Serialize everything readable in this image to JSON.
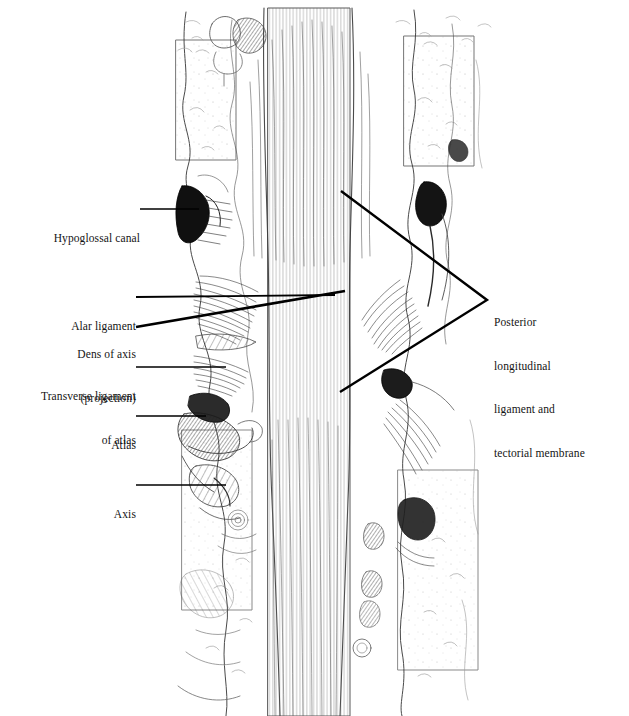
{
  "figure": {
    "kind": "anatomical-illustration",
    "style": "pen-and-ink line drawing",
    "background_color": "#ffffff",
    "ink_color": "#141414",
    "leader_color": "#000000"
  },
  "labels": {
    "hypoglossal_canal": {
      "text": "Hypoglossal canal",
      "align": "right",
      "x": 140,
      "y": 202
    },
    "alar_ligament": {
      "text": "Alar ligament",
      "align": "right",
      "x": 133,
      "y": 290
    },
    "dens_of_axis": {
      "line1": "Dens of axis",
      "line2": "(projection)",
      "align": "right",
      "x": 133,
      "y": 318
    },
    "transverse_ligament": {
      "line1": "Transverse ligament",
      "line2": "of atlas",
      "align": "right",
      "x": 133,
      "y": 360
    },
    "atlas": {
      "text": "Atlas",
      "align": "right",
      "x": 133,
      "y": 409
    },
    "axis": {
      "text": "Axis",
      "align": "right",
      "x": 133,
      "y": 478
    },
    "posterior_longitudinal": {
      "line1": "Posterior",
      "line2": "longitudinal",
      "line3": "ligament and",
      "line4": "tectorial membrane",
      "align": "left",
      "x": 494,
      "y": 286
    }
  },
  "leader_lines": [
    {
      "name": "hypoglossal-canal-leader",
      "x1": 140,
      "y1": 209,
      "x2": 199,
      "y2": 209,
      "width": 1.6
    },
    {
      "name": "alar-ligament-leader",
      "x1": 136,
      "y1": 297,
      "x2": 335,
      "y2": 295,
      "width": 1.8
    },
    {
      "name": "dens-of-axis-leader",
      "x1": 136,
      "y1": 327,
      "x2": 345,
      "y2": 291,
      "width": 2.6
    },
    {
      "name": "transverse-ligament-leader",
      "x1": 136,
      "y1": 367,
      "x2": 226,
      "y2": 367,
      "width": 1.6
    },
    {
      "name": "atlas-leader",
      "x1": 136,
      "y1": 416,
      "x2": 206,
      "y2": 416,
      "width": 1.6
    },
    {
      "name": "axis-leader",
      "x1": 136,
      "y1": 485,
      "x2": 226,
      "y2": 485,
      "width": 1.6
    },
    {
      "name": "posterior-bracket-upper",
      "x1": 341,
      "y1": 191,
      "x2": 487,
      "y2": 300,
      "width": 2.4
    },
    {
      "name": "posterior-bracket-lower",
      "x1": 340,
      "y1": 392,
      "x2": 487,
      "y2": 300,
      "width": 2.4
    }
  ],
  "illustration_regions": [
    {
      "name": "hypoglossal-canal-aperture",
      "side": "left",
      "cx": 196,
      "cy": 212,
      "tone": "dark"
    },
    {
      "name": "occipital-condyle-right",
      "side": "right",
      "cx": 433,
      "cy": 196,
      "tone": "dark"
    },
    {
      "name": "alar-ligament-fibers-left",
      "side": "left",
      "cx": 228,
      "cy": 300,
      "tone": "hatched"
    },
    {
      "name": "alar-ligament-fibers-right",
      "side": "right",
      "cx": 414,
      "cy": 310,
      "tone": "hatched"
    },
    {
      "name": "transverse-ligament-fibers",
      "side": "left",
      "cx": 226,
      "cy": 365,
      "tone": "hatched"
    },
    {
      "name": "atlas-lateral-mass-left",
      "side": "left",
      "cx": 215,
      "cy": 420,
      "tone": "dark"
    },
    {
      "name": "atlas-lateral-mass-right",
      "side": "right",
      "cx": 392,
      "cy": 380,
      "tone": "dark"
    },
    {
      "name": "axis-body-left",
      "side": "left",
      "cx": 218,
      "cy": 480,
      "tone": "hatched"
    },
    {
      "name": "tectorial-membrane-midline",
      "side": "center",
      "cx": 315,
      "cy": 330,
      "tone": "striated"
    },
    {
      "name": "posterior-longitudinal-band",
      "side": "center",
      "cx": 310,
      "cy": 560,
      "tone": "striated"
    },
    {
      "name": "foramen-magnum-rim",
      "side": "center",
      "cx": 300,
      "cy": 60,
      "tone": "light"
    },
    {
      "name": "vertebral-artery-right",
      "side": "right",
      "cx": 408,
      "cy": 520,
      "tone": "light"
    }
  ]
}
